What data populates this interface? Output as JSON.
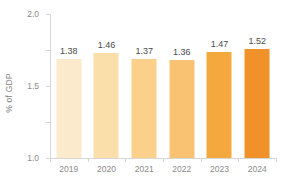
{
  "chart_data": {
    "type": "bar",
    "title": "",
    "subtitle": "",
    "xlabel": "",
    "ylabel": "% of GDP",
    "categories": [
      "2019",
      "2020",
      "2021",
      "2022",
      "2023",
      "2024"
    ],
    "values": [
      1.38,
      1.46,
      1.37,
      1.36,
      1.47,
      1.52
    ],
    "value_labels": [
      "1.38",
      "1.46",
      "1.37",
      "1.36",
      "1.47",
      "1.52"
    ],
    "series": [
      {
        "name": "% of GDP",
        "values": [
          1.38,
          1.46,
          1.37,
          1.36,
          1.47,
          1.52
        ]
      }
    ],
    "ylim": [
      0.0,
      2.0
    ],
    "ytick_values": [
      0.0,
      0.5,
      1.0,
      1.5,
      2.0
    ],
    "ytick_labels": [
      "0.0",
      "0.5",
      "1.0",
      "1.5",
      "2.0"
    ],
    "grid": false,
    "legend": false,
    "legend_position": "none",
    "bar_colors": [
      "#fbeacb",
      "#fbdfab",
      "#fbd08a",
      "#f9c273",
      "#f4a93e",
      "#f0912a"
    ],
    "axis_color": "#d6d6d6",
    "tick_label_color": "#8a8a8a",
    "value_label_color": "#4a4a4a",
    "axis_title_color": "#808080",
    "background_color": "#ffffff"
  }
}
